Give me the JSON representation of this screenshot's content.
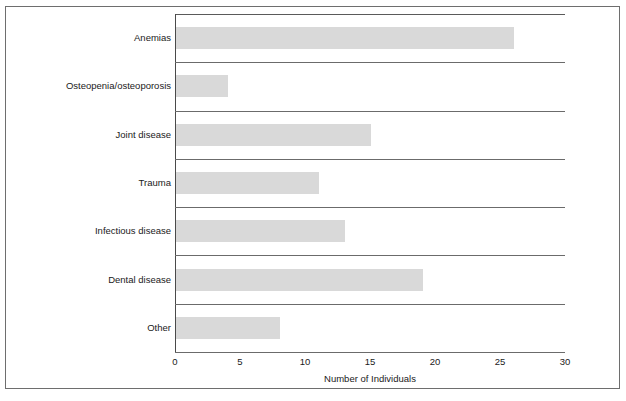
{
  "figure": {
    "background_color": "#ffffff",
    "frame_color": "#6e6e6e",
    "bar_color": "#d9d9d9",
    "axis_color": "#6b6b6b",
    "text_color": "#1a1a1a"
  },
  "chart_data": {
    "type": "bar",
    "orientation": "horizontal",
    "title": "",
    "subtitle": "",
    "xlabel": "Number of Individuals",
    "ylabel": "",
    "xlim": [
      0,
      30
    ],
    "ylim": null,
    "xticks": [
      "0",
      "5",
      "10",
      "15",
      "20",
      "25",
      "30"
    ],
    "xtick_values": [
      0,
      5,
      10,
      15,
      20,
      25,
      30
    ],
    "grid": false,
    "legend": null,
    "legend_position": "none",
    "categories": [
      "Anemias",
      "Osteopenia/osteoporosis",
      "Joint disease",
      "Trauma",
      "Infectious disease",
      "Dental disease",
      "Other"
    ],
    "values": [
      26,
      4,
      15,
      11,
      13,
      19,
      8
    ],
    "annotations": []
  }
}
